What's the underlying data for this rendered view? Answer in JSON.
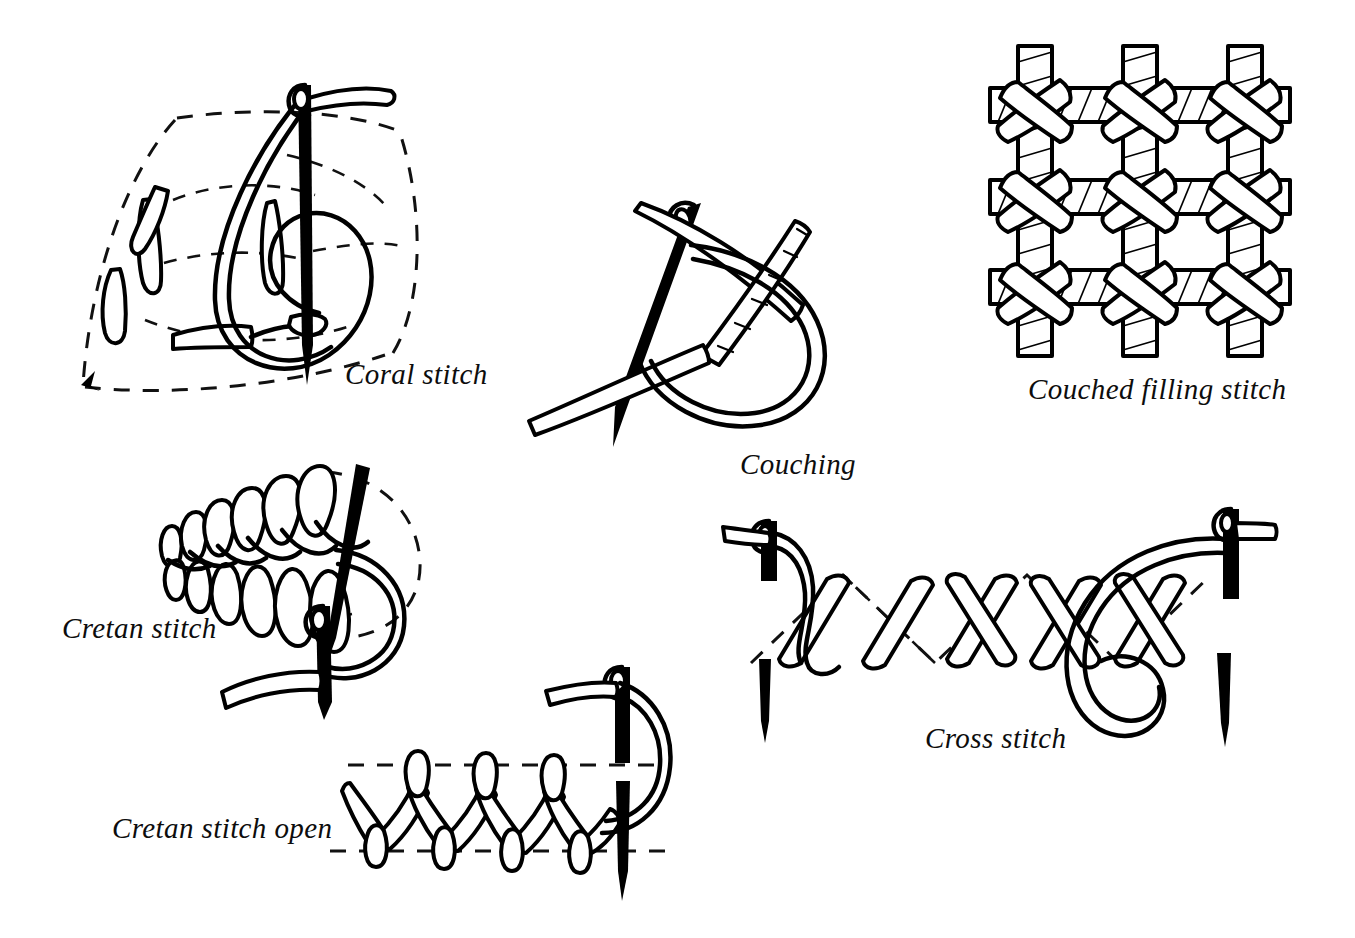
{
  "page": {
    "background_color": "#ffffff",
    "ink_color": "#000000",
    "width": 1355,
    "height": 938
  },
  "figures": [
    {
      "id": "coral-stitch",
      "label": "Coral stitch",
      "label_x": 345,
      "label_y": 358,
      "description": "Needle held vertically pulling a looped thread; knotted stitches along a dashed leaf outline"
    },
    {
      "id": "couching",
      "label": "Couching",
      "label_x": 740,
      "label_y": 448,
      "description": "Needle crossing a laid thread while a twisted working thread forms a loop"
    },
    {
      "id": "couched-filling-stitch",
      "label": "Couched filling stitch",
      "label_x": 1028,
      "label_y": 373,
      "description": "Lattice of laid threads tacked down by small cross stitches at each intersection"
    },
    {
      "id": "cretan-stitch",
      "label": "Cretan stitch",
      "label_x": 62,
      "label_y": 612,
      "description": "Dense interlocking looped spine worked toward a needle, with a dashed guide arc"
    },
    {
      "id": "cretan-stitch-open",
      "label": "Cretan stitch open",
      "label_x": 112,
      "label_y": 812,
      "description": "Open zigzag looped band between two dashed guide lines with a vertical needle"
    },
    {
      "id": "cross-stitch",
      "label": "Cross stitch",
      "label_x": 925,
      "label_y": 722,
      "description": "Row of diagonal bars forming crosses, worked between two needles on dashed guide lines"
    }
  ],
  "caption_style": {
    "font_style": "italic",
    "font_size_px": 29,
    "color": "#0d0d0d"
  }
}
